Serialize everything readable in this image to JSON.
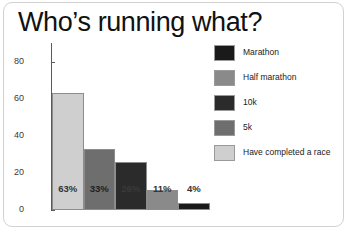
{
  "title": "Who’s running what?",
  "colors": {
    "marathon": "#1a1a1a",
    "half_marathon": "#8a8a8a",
    "ten_k": "#2b2b2b",
    "five_k": "#6e6e6e",
    "completed_race": "#cfcfcf",
    "axis": "#5a5a5a",
    "card_border": "#d2d2d2",
    "background": "#ffffff"
  },
  "legend": {
    "position": "right",
    "items": [
      {
        "label": "Marathon",
        "color": "#1a1a1a"
      },
      {
        "label": "Half marathon",
        "color": "#8a8a8a"
      },
      {
        "label": "10k",
        "color": "#2b2b2b"
      },
      {
        "label": "5k",
        "color": "#6e6e6e"
      },
      {
        "label": "Have completed a race",
        "color": "#cfcfcf"
      }
    ]
  },
  "axis": {
    "y_ticks": [
      "0",
      "20",
      "40",
      "60",
      "80"
    ]
  },
  "chart_data": {
    "type": "bar",
    "title": "Who’s running what?",
    "xlabel": "",
    "ylabel": "",
    "ylim": [
      0,
      90
    ],
    "grid": false,
    "legend_position": "right",
    "categories": [
      "Have completed a race",
      "Half marathon",
      "10k",
      "5k",
      "Marathon"
    ],
    "values": [
      63,
      33,
      26,
      11,
      4
    ],
    "data_labels": [
      "63%",
      "33%",
      "26%",
      "11%",
      "4%"
    ],
    "bar_colors": [
      "#cfcfcf",
      "#6e6e6e",
      "#2b2b2b",
      "#8a8a8a",
      "#1a1a1a"
    ],
    "label_colors": [
      "#333333",
      "#1f1f1f",
      "#3a3a3a",
      "#333333",
      "#333333"
    ],
    "y_tick_values": [
      0,
      20,
      40,
      60,
      80
    ],
    "y_tick_labels": [
      "0",
      "20",
      "40",
      "60",
      "80"
    ]
  }
}
